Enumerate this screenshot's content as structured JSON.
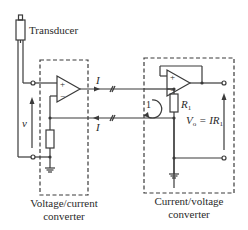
{
  "diagram": {
    "transducer_label": "Transducer",
    "voltage_label": "v",
    "current_label_top": "I",
    "current_label_bottom": "I",
    "loop_label": "1",
    "resistor_label_main": "R",
    "resistor_label_sub": "1",
    "output_eq_lhs_main": "V",
    "output_eq_lhs_sub": "o",
    "output_eq_mid": " = IR",
    "output_eq_rhs_sub": "1",
    "left_box_label_line1": "Voltage/current",
    "left_box_label_line2": "converter",
    "right_box_label_line1": "Current/voltage",
    "right_box_label_line2": "converter",
    "opamp_plus": "+",
    "opamp_minus": "−",
    "line_color": "#3a3a3a"
  }
}
